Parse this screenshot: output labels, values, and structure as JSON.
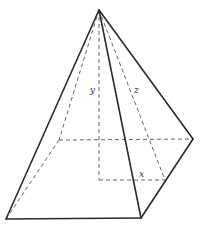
{
  "figure": {
    "type": "square-based pyramid",
    "labels": {
      "height": "y",
      "slant_height": "z",
      "half_base": "x"
    },
    "vertices": {
      "apex": [
        99,
        10
      ],
      "front_left": [
        6,
        219
      ],
      "front_right": [
        141,
        218
      ],
      "back_right": [
        193,
        139
      ],
      "back_left": [
        59,
        140
      ],
      "height_foot": [
        99,
        180
      ],
      "edge_midpoint": [
        165,
        180
      ]
    },
    "colors": {
      "edge": "#2a2a2a",
      "hidden_edge": "#555555",
      "background": "#ffffff"
    }
  }
}
